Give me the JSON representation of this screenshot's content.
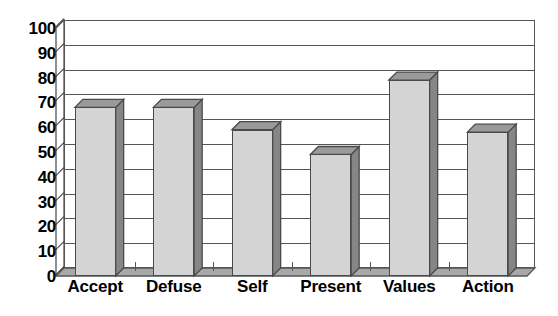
{
  "chart_data": {
    "type": "bar",
    "title": "",
    "subtitle": "",
    "xlabel": "",
    "ylabel": "",
    "categories": [
      "Accept",
      "Defuse",
      "Self",
      "Present",
      "Values",
      "Action"
    ],
    "values": [
      68,
      68,
      59,
      49,
      79,
      58
    ],
    "series": [
      {
        "name": "",
        "values": [
          68,
          68,
          59,
          49,
          79,
          58
        ]
      }
    ],
    "ylim": [
      0,
      100
    ],
    "ytick_labels": [
      "0",
      "10",
      "20",
      "30",
      "40",
      "50",
      "60",
      "70",
      "80",
      "90",
      "100"
    ],
    "ytick_values": [
      0,
      10,
      20,
      30,
      40,
      50,
      60,
      70,
      80,
      90,
      100
    ],
    "ytick_interval": 10,
    "grid": true,
    "grid_axis": "y",
    "legend": false,
    "legend_position": "none",
    "style": "3d-column",
    "colors": {
      "bar_face": "#d4d4d4",
      "bar_side": "#868686",
      "bar_top": "#9a9a9a",
      "bar_outline": "#4a4a4a",
      "grid": "#555555",
      "frame": "#555555",
      "floor": "#a8a8a8",
      "wall": "#ffffff",
      "text": "#000000",
      "background": "#ffffff"
    }
  }
}
